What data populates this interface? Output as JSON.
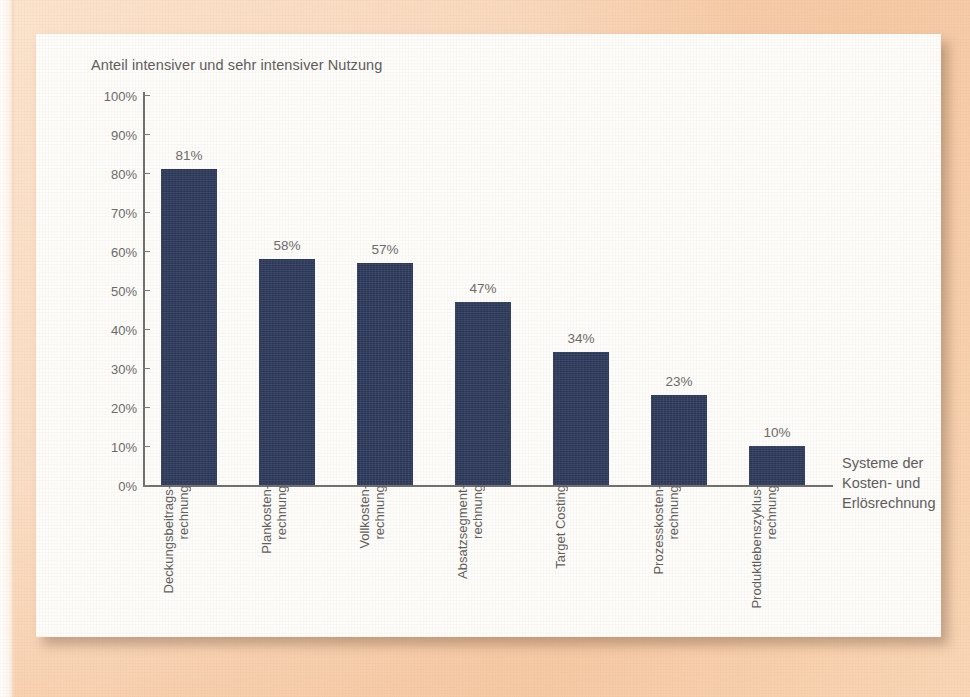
{
  "chart_data": {
    "type": "bar",
    "title": "Anteil intensiver und sehr intensiver Nutzung",
    "xlabel": "Systeme der\nKosten- und\nErlösrechnung",
    "ylabel": "",
    "ylim": [
      0,
      100
    ],
    "yticks": [
      "0%",
      "10%",
      "20%",
      "30%",
      "40%",
      "50%",
      "60%",
      "70%",
      "80%",
      "90%",
      "100%"
    ],
    "ytick_values": [
      0,
      10,
      20,
      30,
      40,
      50,
      60,
      70,
      80,
      90,
      100
    ],
    "grid": false,
    "legend": false,
    "categories": [
      "Deckungsbeitrags-\nrechnung",
      "Plankosten-\nrechnung",
      "Vollkosten-\nrechnung",
      "Absatzsegment-\nrechnung",
      "Target Costing",
      "Prozesskosten-\nrechnung",
      "Produktlebenszyklus-\nrechnung"
    ],
    "values": [
      81,
      58,
      57,
      47,
      34,
      23,
      10
    ],
    "value_labels": [
      "81%",
      "58%",
      "57%",
      "47%",
      "34%",
      "23%",
      "10%"
    ],
    "bar_color": "#2c3a5f",
    "axis_color": "#6e6e6e",
    "text_color": "#5b5b5b",
    "background_color": "#fdfdfb",
    "page_color": "#f7cdaa"
  }
}
